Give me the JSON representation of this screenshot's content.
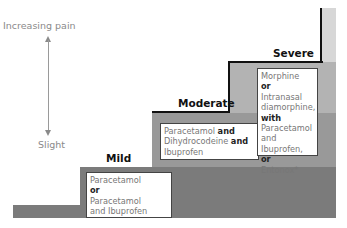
{
  "axis": {
    "top_label": "Increasing pain",
    "bottom_label": "Slight"
  },
  "steps": [
    {
      "title": "Mild",
      "lines": [
        {
          "text": "Paracetamol",
          "bold": false
        },
        {
          "text": "or",
          "bold": true
        },
        {
          "text": "Paracetamol",
          "bold": false
        },
        {
          "text": "and Ibuprofen",
          "bold": false
        }
      ]
    },
    {
      "title": "Moderate",
      "lines": [
        {
          "parts": [
            {
              "text": "Paracetamol ",
              "bold": false
            },
            {
              "text": "and",
              "bold": true
            }
          ]
        },
        {
          "parts": [
            {
              "text": "Dihydrocodeine ",
              "bold": false
            },
            {
              "text": "and",
              "bold": true
            }
          ]
        },
        {
          "parts": [
            {
              "text": "Ibuprofen",
              "bold": false
            }
          ]
        }
      ]
    },
    {
      "title": "Severe",
      "lines": [
        {
          "parts": [
            {
              "text": "Morphine",
              "bold": false
            }
          ]
        },
        {
          "parts": [
            {
              "text": "or",
              "bold": true
            },
            {
              "text": " Intranasal",
              "bold": false
            }
          ]
        },
        {
          "parts": [
            {
              "text": "diamorphine,",
              "bold": false
            }
          ]
        },
        {
          "parts": [
            {
              "text": "with",
              "bold": true
            }
          ]
        },
        {
          "parts": [
            {
              "text": "Paracetamol",
              "bold": false
            }
          ]
        },
        {
          "parts": [
            {
              "text": "and Ibuprofen,",
              "bold": false
            }
          ]
        },
        {
          "parts": [
            {
              "text": "or",
              "bold": true
            }
          ]
        },
        {
          "parts": [
            {
              "text": "Entonox*",
              "bold": false
            }
          ]
        }
      ]
    }
  ],
  "colors": {
    "band_darkest": "#7b7b7b",
    "band_dark": "#999999",
    "band_mid": "#b3b3b3",
    "band_light": "#d7d7d7",
    "stair_line": "#111111"
  }
}
